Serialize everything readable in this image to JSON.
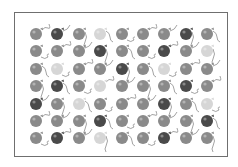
{
  "figure": {
    "columns": 9,
    "rows": 7,
    "shades": {
      "D": "#4a4a4a",
      "M": "#8a8a8a",
      "L": "#d6d6d6"
    },
    "string_color": "#8c8c8c",
    "frame_color": "#6f6f6f",
    "grid": [
      [
        "M",
        "D",
        "M",
        "L",
        "M",
        "M",
        "M",
        "D",
        "M"
      ],
      [
        "M",
        "M",
        "M",
        "D",
        "M",
        "M",
        "D",
        "M",
        "L"
      ],
      [
        "M",
        "L",
        "M",
        "M",
        "D",
        "M",
        "L",
        "M",
        "M"
      ],
      [
        "M",
        "D",
        "M",
        "L",
        "M",
        "M",
        "M",
        "D",
        "M"
      ],
      [
        "D",
        "M",
        "L",
        "M",
        "M",
        "M",
        "D",
        "M",
        "L"
      ],
      [
        "M",
        "M",
        "M",
        "D",
        "M",
        "M",
        "M",
        "M",
        "D"
      ],
      [
        "M",
        "D",
        "M",
        "L",
        "M",
        "M",
        "D",
        "M",
        "M"
      ]
    ],
    "counts": {
      "dark": 14,
      "medium": 40,
      "light": 9,
      "total": 63
    }
  }
}
